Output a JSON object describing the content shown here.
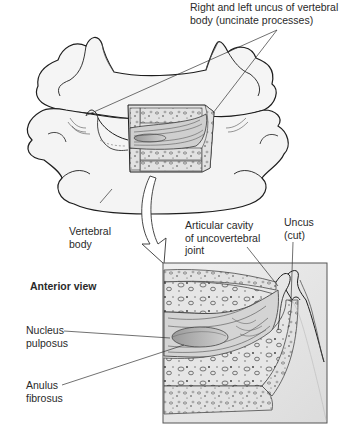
{
  "figure": {
    "view_label": "Anterior view",
    "labels": {
      "uncus_pair": {
        "line1": "Right and left uncus of vertebral",
        "line2": "body (uncinate processes)"
      },
      "vertebral_body": {
        "line1": "Vertebral",
        "line2": "body"
      },
      "articular_cavity": {
        "line1": "Articular cavity",
        "line2": "of uncovertebral",
        "line3": "joint"
      },
      "uncus_cut": {
        "line1": "Uncus",
        "line2": "(cut)"
      },
      "nucleus": {
        "line1": "Nucleus",
        "line2": "pulposus"
      },
      "anulus": {
        "line1": "Anulus",
        "line2": "fibrosus"
      }
    },
    "colors": {
      "bone_fill": "#f4f4f4",
      "outline": "#1e1e1e",
      "inset_bg": "#e9e9e9",
      "disc_fill": "#d8d8d8"
    }
  }
}
